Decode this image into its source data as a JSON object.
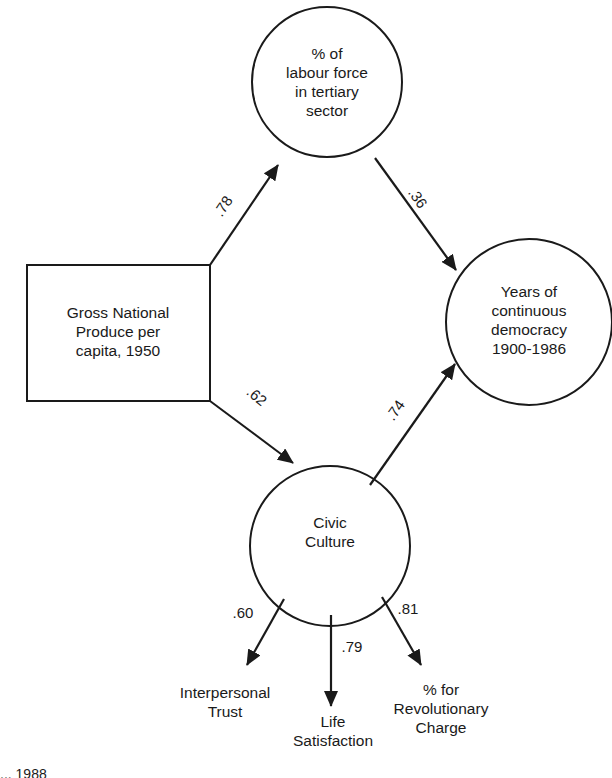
{
  "diagram": {
    "type": "path-diagram",
    "nodes": {
      "gnp": {
        "shape": "rectangle",
        "lines": [
          "Gross National",
          "Produce per",
          "capita, 1950"
        ]
      },
      "labour": {
        "shape": "circle",
        "lines": [
          "% of",
          "labour force",
          "in tertiary",
          "sector"
        ]
      },
      "democracy": {
        "shape": "circle",
        "lines": [
          "Years of",
          "continuous",
          "democracy",
          "1900-1986"
        ]
      },
      "civic": {
        "shape": "circle",
        "lines": [
          "Civic",
          "Culture"
        ]
      },
      "trust": {
        "shape": "indicator",
        "lines": [
          "Interpersonal",
          "Trust"
        ]
      },
      "life": {
        "shape": "indicator",
        "lines": [
          "Life",
          "Satisfaction"
        ]
      },
      "revolution": {
        "shape": "indicator",
        "lines": [
          "% for",
          "Revolutionary",
          "Charge"
        ]
      }
    },
    "edges": [
      {
        "from": "gnp",
        "to": "labour",
        "coefficient": ".78"
      },
      {
        "from": "labour",
        "to": "democracy",
        "coefficient": ".36"
      },
      {
        "from": "gnp",
        "to": "civic",
        "coefficient": ".62"
      },
      {
        "from": "civic",
        "to": "democracy",
        "coefficient": ".74"
      },
      {
        "from": "civic",
        "to": "trust",
        "coefficient": ".60"
      },
      {
        "from": "civic",
        "to": "life",
        "coefficient": ".79"
      },
      {
        "from": "civic",
        "to": "revolution",
        "coefficient": ".81"
      }
    ],
    "source_line_partial": "... 1988"
  }
}
